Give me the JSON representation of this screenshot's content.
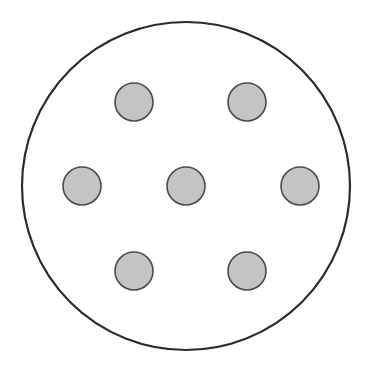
{
  "figure": {
    "title": "",
    "width": 372,
    "height": 369,
    "background_color": "#ffffff"
  },
  "chart_data": {
    "type": "scatter",
    "title": "",
    "subtitle": "",
    "xlabel": "",
    "ylabel": "",
    "grid": false,
    "legend": false,
    "xlim": [
      0,
      372
    ],
    "ylim": [
      0,
      369
    ],
    "container": {
      "name": "outer-boundary-circle",
      "shape": "circle",
      "cx": 186,
      "cy": 186,
      "r": 164,
      "fill": "none",
      "stroke": "#2b2b2b",
      "stroke_width": 2.2
    },
    "point_style": {
      "shape": "circle",
      "r": 19,
      "fill": "#c4c4c4",
      "stroke": "#4a4a4a",
      "stroke_width": 1.6
    },
    "series": [
      {
        "name": "packed-circles",
        "count": 7,
        "points": [
          {
            "label": "center",
            "x": 186,
            "y": 186,
            "r": 19
          },
          {
            "label": "top-left",
            "x": 134,
            "y": 102,
            "r": 19
          },
          {
            "label": "top-right",
            "x": 247,
            "y": 102,
            "r": 19
          },
          {
            "label": "middle-left",
            "x": 82,
            "y": 186,
            "r": 19
          },
          {
            "label": "middle-right",
            "x": 300,
            "y": 186,
            "r": 19
          },
          {
            "label": "bottom-left",
            "x": 134,
            "y": 271,
            "r": 19
          },
          {
            "label": "bottom-right",
            "x": 247,
            "y": 271,
            "r": 19
          }
        ]
      }
    ],
    "annotations": []
  }
}
